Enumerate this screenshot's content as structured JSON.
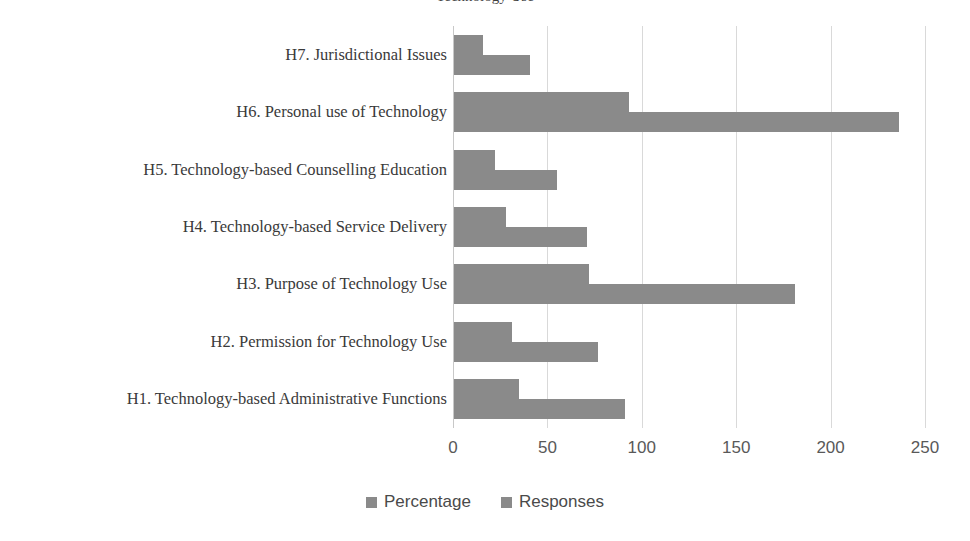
{
  "title_sliver": "Technology Use",
  "colors": {
    "bar": "#8a8a8a",
    "gridline": "#d9d9d9",
    "axis": "#c8c8c8",
    "label_text": "#3a3a3a",
    "tick_text": "#595959",
    "legend_text": "#4a4a4a",
    "background": "#ffffff"
  },
  "legend": {
    "position": "bottom-center",
    "items": [
      {
        "label": "Percentage",
        "swatch": "legend-swatch-percentage"
      },
      {
        "label": "Responses",
        "swatch": "legend-swatch-responses"
      }
    ]
  },
  "axis": {
    "ticks": [
      "0",
      "50",
      "100",
      "150",
      "200",
      "250"
    ],
    "tick_values": [
      0,
      50,
      100,
      150,
      200,
      250
    ]
  },
  "chart_data": {
    "type": "bar",
    "orientation": "horizontal",
    "title": "",
    "xlabel": "",
    "ylabel": "",
    "xlim": [
      0,
      250
    ],
    "grid": true,
    "legend_position": "bottom-center",
    "categories": [
      "H1. Technology-based Administrative Functions",
      "H2. Permission for Technology Use",
      "H3. Purpose of Technology Use",
      "H4. Technology-based Service Delivery",
      "H5. Technology-based Counselling Education",
      "H6. Personal use of Technology",
      "H7. Jurisdictional Issues"
    ],
    "series": [
      {
        "name": "Percentage",
        "values": [
          35,
          31,
          72,
          28,
          22,
          93,
          16
        ]
      },
      {
        "name": "Responses",
        "values": [
          91,
          77,
          181,
          71,
          55,
          236,
          41
        ]
      }
    ]
  }
}
